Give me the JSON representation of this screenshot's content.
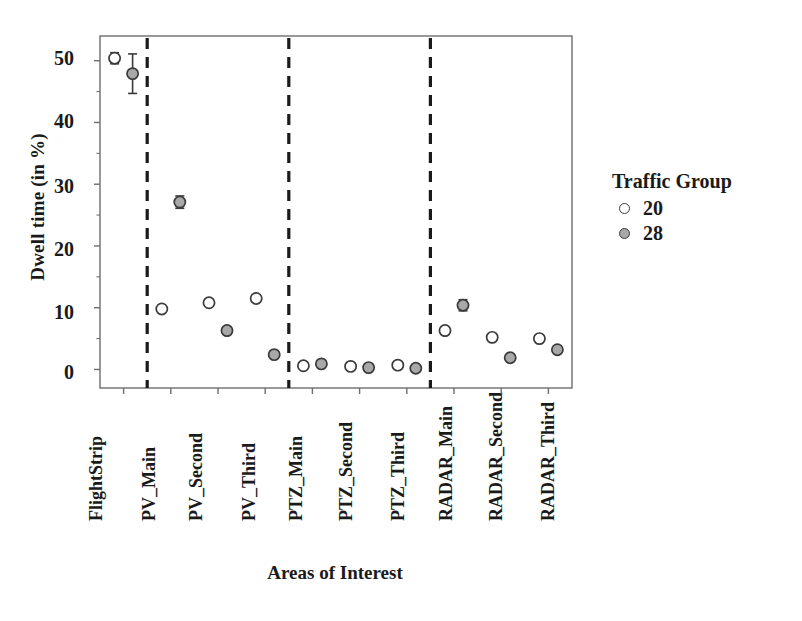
{
  "chart_data": {
    "type": "scatter",
    "title": "",
    "xlabel": "Areas of Interest",
    "ylabel": "Dwell time (in %)",
    "categories": [
      "FlightStrip",
      "PV_Main",
      "PV_Second",
      "PV_Third",
      "PTZ_Main",
      "PTZ_Second",
      "PTZ_Third",
      "RADAR_Main",
      "RADAR_Second",
      "RADAR_Third"
    ],
    "ylim": [
      -3,
      54
    ],
    "yticks": [
      0,
      10,
      20,
      30,
      40,
      50
    ],
    "ytick_labels": [
      "0",
      "10",
      "20",
      "30",
      "40",
      "50"
    ],
    "grid": false,
    "legend_position": "right",
    "legend_title": "Traffic Group",
    "series": [
      {
        "name": "20",
        "marker": "open-circle",
        "color": "#ffffff",
        "edge_color": "#3a3a3a",
        "values": [
          50.4,
          9.8,
          10.8,
          11.5,
          0.6,
          0.5,
          0.7,
          6.3,
          5.2,
          5.0
        ],
        "errors": [
          0.9,
          0.45,
          0.55,
          0.55,
          0.2,
          0.15,
          0.2,
          0.5,
          0.4,
          0.4
        ]
      },
      {
        "name": "28",
        "marker": "filled-circle",
        "color": "#a8a8a8",
        "edge_color": "#3a3a3a",
        "values": [
          47.9,
          27.1,
          6.3,
          2.4,
          0.9,
          0.3,
          0.2,
          10.4,
          1.9,
          3.2
        ],
        "errors": [
          3.2,
          1.0,
          0.5,
          0.5,
          0.25,
          0.15,
          0.15,
          0.9,
          0.4,
          0.4
        ]
      }
    ],
    "group_separators": [
      "PV_Main",
      "PTZ_Main",
      "RADAR_Main"
    ],
    "separator_style": "dashed"
  },
  "axes": {
    "y_title": "Dwell time (in %)",
    "x_title": "Areas of Interest",
    "y_tick_labels": [
      "50",
      "40",
      "30",
      "20",
      "10",
      "0"
    ],
    "x_tick_labels": [
      "FlightStrip",
      "PV_Main",
      "PV_Second",
      "PV_Third",
      "PTZ_Main",
      "PTZ_Second",
      "PTZ_Third",
      "RADAR_Main",
      "RADAR_Second",
      "RADAR_Third"
    ]
  },
  "legend": {
    "title": "Traffic Group",
    "items": [
      {
        "label": "20",
        "marker": "open-circle"
      },
      {
        "label": "28",
        "marker": "filled-circle"
      }
    ]
  },
  "colors": {
    "axis": "#6e6e6e",
    "marker_edge": "#3a3a3a",
    "marker_fill_group28": "#a8a8a8",
    "marker_fill_group20": "#ffffff",
    "separator": "#1a1a1a",
    "text": "#1a1a1a",
    "background": "#ffffff"
  }
}
